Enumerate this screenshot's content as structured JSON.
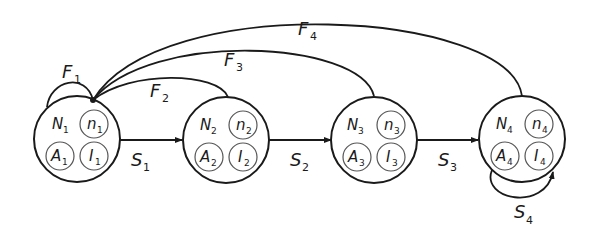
{
  "diagram": {
    "type": "state-transition",
    "nodes": [
      {
        "id": "1",
        "N": "N",
        "n": "n",
        "A": "A",
        "I": "I",
        "sub": "1"
      },
      {
        "id": "2",
        "N": "N",
        "n": "n",
        "A": "A",
        "I": "I",
        "sub": "2"
      },
      {
        "id": "3",
        "N": "N",
        "n": "n",
        "A": "A",
        "I": "I",
        "sub": "3"
      },
      {
        "id": "4",
        "N": "N",
        "n": "n",
        "A": "A",
        "I": "I",
        "sub": "4"
      }
    ],
    "edges": {
      "S1": {
        "main": "S",
        "sub": "1",
        "from": "node-1",
        "to": "node-2"
      },
      "S2": {
        "main": "S",
        "sub": "2",
        "from": "node-2",
        "to": "node-3"
      },
      "S3": {
        "main": "S",
        "sub": "3",
        "from": "node-3",
        "to": "node-4"
      },
      "S4": {
        "main": "S",
        "sub": "4",
        "from": "node-4",
        "to": "node-4"
      },
      "F1": {
        "main": "F",
        "sub": "1",
        "from": "node-1",
        "to": "node-1"
      },
      "F2": {
        "main": "F",
        "sub": "2",
        "from": "node-2",
        "to": "node-1"
      },
      "F3": {
        "main": "F",
        "sub": "3",
        "from": "node-3",
        "to": "node-1"
      },
      "F4": {
        "main": "F",
        "sub": "4",
        "from": "node-4",
        "to": "node-1"
      }
    },
    "colors": {
      "stroke": "#1a1a1a",
      "inner_stroke": "#555555",
      "background": "#ffffff"
    }
  }
}
